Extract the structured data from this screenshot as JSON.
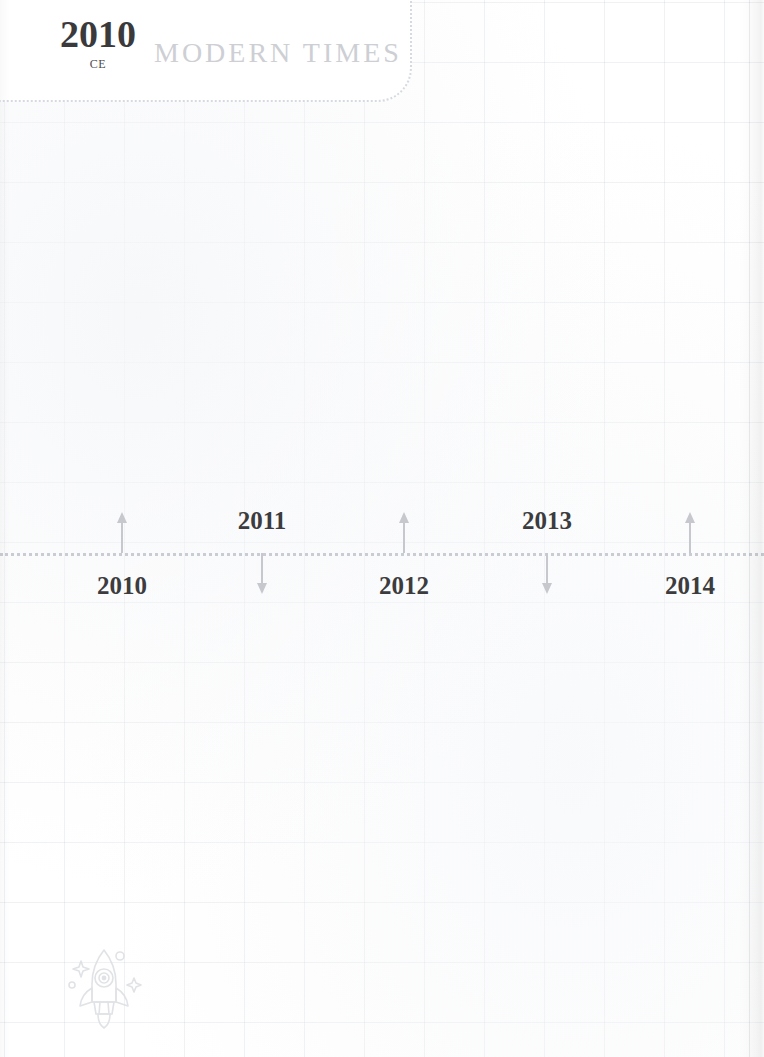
{
  "page": {
    "background_color": "#ffffff",
    "grid_line_color": "#eef0f3",
    "width": 764,
    "height": 1057
  },
  "era_banner": {
    "year": "2010",
    "year_suffix": "CE",
    "era_name": "MODERN TIMES",
    "year_color": "#3a3a3c",
    "era_name_color": "#cdcfd4",
    "border_color": "#d6dae0"
  },
  "timeline": {
    "axis_color": "#c9ccd2",
    "arrow_color": "#c6c8ce",
    "label_color": "#3c3c3e",
    "ticks": [
      {
        "label": "2010",
        "x": 122,
        "direction": "up"
      },
      {
        "label": "2011",
        "x": 262,
        "direction": "down"
      },
      {
        "label": "2012",
        "x": 404,
        "direction": "up"
      },
      {
        "label": "2013",
        "x": 547,
        "direction": "down"
      },
      {
        "label": "2014",
        "x": 690,
        "direction": "up"
      }
    ]
  },
  "ornament": {
    "icon": "rocket-icon",
    "color": "#dcdee2"
  }
}
